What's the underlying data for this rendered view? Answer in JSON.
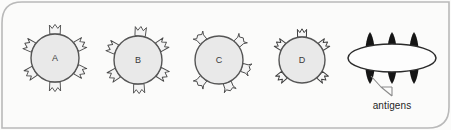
{
  "figure": {
    "background_color": "#fbfbfa",
    "frame": {
      "stroke_color": "#b9b9b9",
      "corner_rounded": "top-left, bottom-right"
    }
  },
  "cells": [
    {
      "label": "A",
      "receptor_shape": "crown",
      "receptor_count": 6,
      "fill_color": "#e9e9e9",
      "stroke_color": "#555555",
      "cx": 55,
      "cy": 58,
      "r": 24
    },
    {
      "label": "B",
      "receptor_shape": "crown",
      "receptor_count": 6,
      "fill_color": "#e9e9e9",
      "stroke_color": "#555555",
      "cx": 138,
      "cy": 60,
      "r": 24
    },
    {
      "label": "C",
      "receptor_shape": "y-fork",
      "receptor_count": 5,
      "fill_color": "#e9e9e9",
      "stroke_color": "#555555",
      "cx": 219,
      "cy": 60,
      "r": 24
    },
    {
      "label": "D",
      "receptor_shape": "m-prong",
      "receptor_count": 5,
      "fill_color": "#e9e9e9",
      "stroke_color": "#555555",
      "cx": 302,
      "cy": 60,
      "r": 23
    }
  ],
  "pathogen": {
    "shape": "ellipse",
    "fill_color": "#fdfdfd",
    "stroke_color": "#2a2a2a",
    "cx": 392,
    "cy": 58,
    "rx": 44,
    "ry": 14,
    "antigen_color": "#151515",
    "antigen_count": 3,
    "antigen_x": [
      370,
      392,
      414
    ],
    "callout_label": "antigens",
    "callout_x": 392,
    "callout_y": 104,
    "leader_color": "#7a7a7a"
  }
}
